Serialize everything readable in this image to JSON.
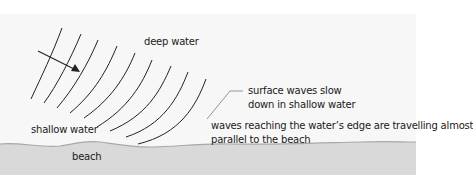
{
  "diagram": {
    "colors": {
      "background": "#ffffff",
      "water": "#f7f7f7",
      "beach": "#d9d9d9",
      "shoreline": "#a8a8a8",
      "wave_line": "#222222",
      "leader_line": "#888888",
      "text": "#1a1a1a"
    },
    "labels": {
      "deep_water": "deep water",
      "shallow_water": "shallow water",
      "beach": "beach",
      "surface_waves_line1": "surface waves slow",
      "surface_waves_line2": "down in shallow water",
      "waves_reaching_line1": "waves reaching the water’s edge are travelling almost",
      "waves_reaching_line2": "parallel to the beach"
    },
    "wave_count": 9,
    "arrow": "direction-of-wave-travel"
  }
}
